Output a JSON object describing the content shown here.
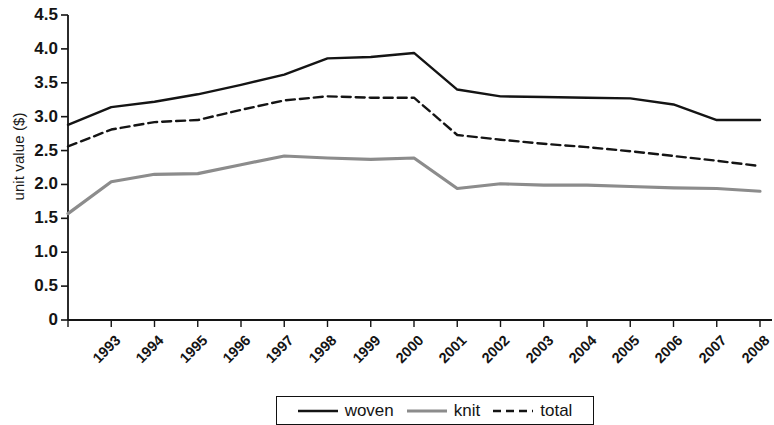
{
  "chart_data": {
    "type": "line",
    "title": "",
    "xlabel": "",
    "ylabel": "unit value ($)",
    "categories": [
      "1993",
      "1994",
      "1995",
      "1996",
      "1997",
      "1998",
      "1999",
      "2000",
      "2001",
      "2002",
      "2003",
      "2004",
      "2005",
      "2006",
      "2007",
      "2008",
      "2009"
    ],
    "ylim": [
      0,
      4.5
    ],
    "ytick_labels": [
      "4.5",
      "4.0",
      "3.5",
      "3.0",
      "2.5",
      "2.0",
      "1.5",
      "1.0",
      "0.5",
      "0"
    ],
    "ytick_values": [
      4.5,
      4.0,
      3.5,
      3.0,
      2.5,
      2.0,
      1.5,
      1.0,
      0.5,
      0
    ],
    "grid": false,
    "legend_position": "bottom-center",
    "series": [
      {
        "name": "woven",
        "color": "#141414",
        "style": "solid",
        "values": [
          2.88,
          3.14,
          3.22,
          3.33,
          3.47,
          3.62,
          3.86,
          3.88,
          3.94,
          3.4,
          3.3,
          3.29,
          3.28,
          3.27,
          3.18,
          2.95,
          2.95
        ]
      },
      {
        "name": "knit",
        "color": "#8c8c8c",
        "style": "solid",
        "values": [
          1.57,
          2.04,
          2.15,
          2.16,
          2.29,
          2.42,
          2.39,
          2.37,
          2.39,
          1.94,
          2.01,
          1.99,
          1.99,
          1.97,
          1.95,
          1.94,
          1.9
        ]
      },
      {
        "name": "total",
        "color": "#141414",
        "style": "dashed",
        "values": [
          2.56,
          2.81,
          2.92,
          2.95,
          3.1,
          3.24,
          3.3,
          3.28,
          3.28,
          2.73,
          2.66,
          2.6,
          2.55,
          2.49,
          2.42,
          2.35,
          2.27
        ]
      }
    ]
  },
  "legend": {
    "items": [
      {
        "label": "woven",
        "swatch": "solid-black-line"
      },
      {
        "label": "knit",
        "swatch": "solid-gray-line"
      },
      {
        "label": "total",
        "swatch": "dashed-black-line"
      }
    ]
  },
  "axes": {
    "y_axis_title": "unit value ($)"
  }
}
